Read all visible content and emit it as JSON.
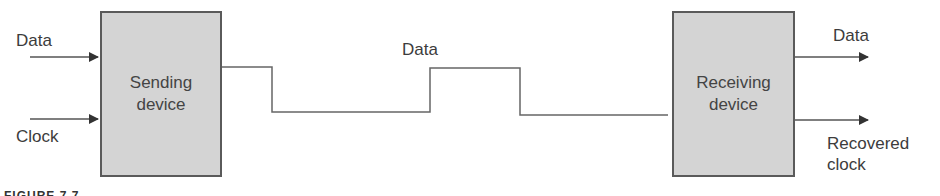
{
  "diagram": {
    "type": "synchronous-transmission-with-clock-recovery",
    "sender": {
      "label_line1": "Sending",
      "label_line2": "device",
      "inputs": [
        "Data",
        "Clock"
      ]
    },
    "channel": {
      "label": "Data",
      "waveform": [
        "high",
        "low",
        "high",
        "low"
      ]
    },
    "receiver": {
      "label_line1": "Receiving",
      "label_line2": "device",
      "outputs": [
        "Data",
        "Recovered clock"
      ],
      "output_recovered_line1": "Recovered",
      "output_recovered_line2": "clock"
    },
    "caption": "FIGURE 7.7"
  },
  "colors": {
    "box_fill": "#d4d4d4",
    "box_border": "#5a5a5a",
    "line": "#555555",
    "text": "#3c3c3c"
  }
}
